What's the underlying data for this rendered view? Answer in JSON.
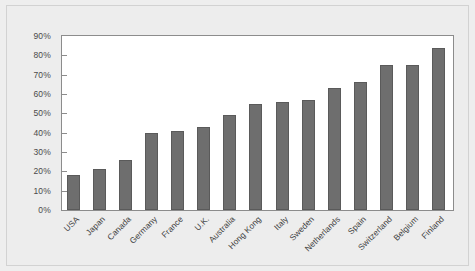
{
  "chart_data": {
    "type": "bar",
    "title": "",
    "subtitle": "",
    "xlabel": "",
    "ylabel": "",
    "categories": [
      "USA",
      "Japan",
      "Canada",
      "Germany",
      "France",
      "U.K.",
      "Australia",
      "Hong Kong",
      "Italy",
      "Sweden",
      "Netherlands",
      "Spain",
      "Switzerland",
      "Belgium",
      "Finland"
    ],
    "values": [
      18,
      21,
      26,
      40,
      41,
      43,
      49,
      55,
      56,
      57,
      63,
      66,
      75,
      75,
      84
    ],
    "value_suffix": "%",
    "ylim": [
      0,
      90
    ],
    "ytick_values": [
      0,
      10,
      20,
      30,
      40,
      50,
      60,
      70,
      80,
      90
    ],
    "ytick_labels": [
      "0%",
      "10%",
      "20%",
      "30%",
      "40%",
      "50%",
      "60%",
      "70%",
      "80%",
      "90%"
    ],
    "grid": false,
    "legend": null,
    "legend_position": "none",
    "bar_color": "#6e6e6e",
    "bar_border_color": "#5a5a5a",
    "plot_background": "#ffffff",
    "figure_background": "#ededed",
    "axis_color": "#8c8c8c",
    "tick_label_color": "#4a4a4a",
    "category_label_color": "#3f3f3f",
    "category_label_rotation": -45
  }
}
